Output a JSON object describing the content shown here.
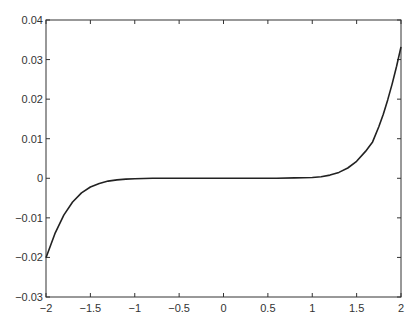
{
  "chart_data": {
    "type": "line",
    "title": "",
    "xlabel": "",
    "ylabel": "",
    "xlim": [
      -2,
      2
    ],
    "ylim": [
      -0.03,
      0.04
    ],
    "grid": false,
    "legend": null,
    "x_ticks": [
      "-2",
      "-1.5",
      "-1",
      "-0.5",
      "0",
      "0.5",
      "1",
      "1.5",
      "2"
    ],
    "x_tick_values": [
      -2,
      -1.5,
      -1,
      -0.5,
      0,
      0.5,
      1,
      1.5,
      2
    ],
    "y_ticks": [
      "-0.03",
      "-0.02",
      "-0.01",
      "0",
      "0.01",
      "0.02",
      "0.03",
      "0.04"
    ],
    "y_tick_values": [
      -0.03,
      -0.02,
      -0.01,
      0,
      0.01,
      0.02,
      0.03,
      0.04
    ],
    "series": [
      {
        "name": "curve",
        "color": "#222222",
        "x": [
          -2,
          -1.9,
          -1.8,
          -1.7,
          -1.6,
          -1.5,
          -1.4,
          -1.3,
          -1.2,
          -1.1,
          -1.0,
          -0.8,
          -0.6,
          -0.4,
          -0.2,
          0,
          0.2,
          0.4,
          0.6,
          0.8,
          1.0,
          1.1,
          1.2,
          1.3,
          1.4,
          1.5,
          1.6,
          1.68,
          1.75,
          1.8,
          1.85,
          1.9,
          1.95,
          2.0
        ],
        "y": [
          -0.0201,
          -0.014,
          -0.0093,
          -0.006,
          -0.0037,
          -0.0022,
          -0.0013,
          -0.0007,
          -0.0004,
          -0.0002,
          -0.0001,
          0,
          0,
          0,
          0,
          0,
          0,
          0,
          0,
          0.0001,
          0.0002,
          0.0004,
          0.0008,
          0.0015,
          0.0026,
          0.0043,
          0.0068,
          0.0092,
          0.013,
          0.0162,
          0.0198,
          0.0238,
          0.0283,
          0.0332
        ]
      }
    ]
  }
}
